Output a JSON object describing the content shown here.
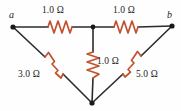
{
  "figure": {
    "type": "circuit-diagram",
    "background_color": "#fefefe",
    "wire_color": "#2b2b2b",
    "resistor_color": "#c0522f",
    "text_color": "#1a1a1a"
  },
  "terminals": [
    {
      "id": "a",
      "label": "a",
      "x": 13,
      "y": 27,
      "label_x": 9,
      "label_y": 10
    },
    {
      "id": "b",
      "label": "b",
      "x": 172,
      "y": 26,
      "label_x": 167,
      "label_y": 10
    }
  ],
  "junctions": [
    {
      "id": "top-center",
      "x": 93,
      "y": 27
    },
    {
      "id": "bottom-vertex",
      "x": 92,
      "y": 103
    }
  ],
  "resistors": [
    {
      "id": "r-top-left",
      "label": "1.0 Ω",
      "value": 1.0,
      "unit": "Ω",
      "from": "a",
      "to": "top-center",
      "orientation": "horizontal",
      "label_x": 42,
      "label_y": 6
    },
    {
      "id": "r-top-right",
      "label": "1.0 Ω",
      "value": 1.0,
      "unit": "Ω",
      "from": "top-center",
      "to": "b",
      "orientation": "horizontal",
      "label_x": 113,
      "label_y": 6
    },
    {
      "id": "r-center-vertical",
      "label": "1.0 Ω",
      "value": 1.0,
      "unit": "Ω",
      "from": "top-center",
      "to": "bottom-vertex",
      "orientation": "vertical",
      "label_x": 97,
      "label_y": 57
    },
    {
      "id": "r-left-diagonal",
      "label": "3.0 Ω",
      "value": 3.0,
      "unit": "Ω",
      "from": "a",
      "to": "bottom-vertex",
      "orientation": "diagonal-down-right",
      "label_x": 18,
      "label_y": 70
    },
    {
      "id": "r-right-diagonal",
      "label": "5.0 Ω",
      "value": 5.0,
      "unit": "Ω",
      "from": "b",
      "to": "bottom-vertex",
      "orientation": "diagonal-down-left",
      "label_x": 136,
      "label_y": 70
    }
  ]
}
